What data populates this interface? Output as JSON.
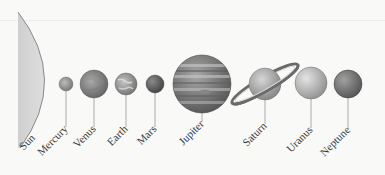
{
  "diagram": {
    "colors": {
      "background": "#f9f9f8",
      "sun_fill": "#d4d4d4",
      "sun_edge": "#8a8a8a",
      "leader_line": "#9a9a9a",
      "label_text": "#3a3a3a"
    },
    "bodies": [
      {
        "name": "Sun",
        "label": "Sun"
      },
      {
        "name": "Mercury",
        "label": "Mercury"
      },
      {
        "name": "Venus",
        "label": "Venus"
      },
      {
        "name": "Earth",
        "label": "Earth"
      },
      {
        "name": "Mars",
        "label": "Mars"
      },
      {
        "name": "Jupiter",
        "label": "Jupiter"
      },
      {
        "name": "Saturn",
        "label": "Saturn"
      },
      {
        "name": "Uranus",
        "label": "Uranus"
      },
      {
        "name": "Neptune",
        "label": "Neptune"
      }
    ]
  }
}
